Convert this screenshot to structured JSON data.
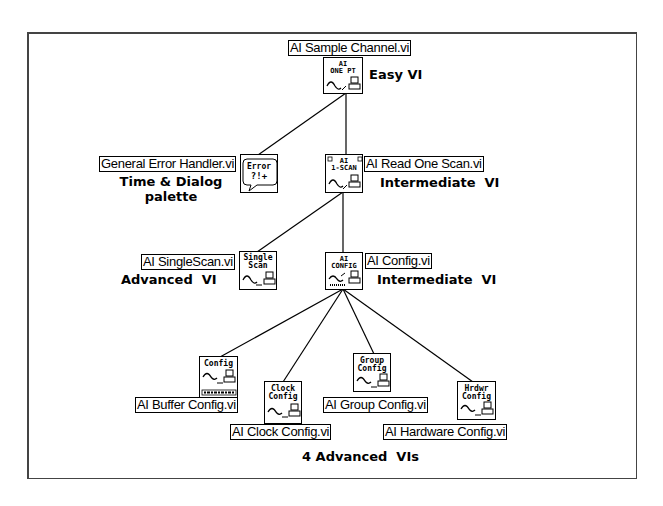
{
  "diagram": {
    "type": "hierarchy",
    "title": "",
    "nodes": [
      {
        "id": "sample",
        "vi_name": "AI Sample Channel.vi",
        "icon_text": [
          "AI",
          "ONE PT"
        ],
        "level_label": "Easy VI"
      },
      {
        "id": "error",
        "vi_name": "General Error Handler.vi",
        "icon_text": [
          "Error",
          "?!+"
        ],
        "level_label": "Time & Dialog palette",
        "level_label_lines": [
          "Time & Dialog",
          "palette"
        ]
      },
      {
        "id": "readone",
        "vi_name": "AI Read One Scan.vi",
        "icon_text": [
          "AI",
          "1-SCAN"
        ],
        "level_label": "Intermediate  VI"
      },
      {
        "id": "singlescan",
        "vi_name": "AI SingleScan.vi",
        "icon_text": [
          "Single",
          "Scan"
        ],
        "level_label": "Advanced  VI"
      },
      {
        "id": "config",
        "vi_name": "AI Config.vi",
        "icon_text": [
          "AI",
          "CONFIG"
        ],
        "level_label": "Intermediate  VI"
      },
      {
        "id": "buffer",
        "vi_name": "AI Buffer Config.vi",
        "icon_text": [
          "Config"
        ]
      },
      {
        "id": "clock",
        "vi_name": "AI Clock Config.vi",
        "icon_text": [
          "Clock",
          "Config"
        ]
      },
      {
        "id": "group",
        "vi_name": "AI Group Config.vi",
        "icon_text": [
          "Group",
          "Config"
        ]
      },
      {
        "id": "hardware",
        "vi_name": "AI Hardware Config.vi",
        "icon_text": [
          "Hrdwr",
          "Config"
        ]
      }
    ],
    "edges": [
      [
        "sample",
        "error"
      ],
      [
        "sample",
        "readone"
      ],
      [
        "readone",
        "singlescan"
      ],
      [
        "readone",
        "config"
      ],
      [
        "config",
        "buffer"
      ],
      [
        "config",
        "clock"
      ],
      [
        "config",
        "group"
      ],
      [
        "config",
        "hardware"
      ]
    ],
    "footer_label": "4 Advanced  VIs"
  },
  "labels": {
    "sample": "AI Sample Channel.vi",
    "sample_note": "Easy VI",
    "error": "General Error Handler.vi",
    "error_note_1": "Time & Dialog",
    "error_note_2": "palette",
    "readone": "AI Read One Scan.vi",
    "readone_note": "Intermediate  VI",
    "singlescan": "AI SingleScan.vi",
    "singlescan_note": "Advanced  VI",
    "config": "AI Config.vi",
    "config_note": "Intermediate  VI",
    "buffer": "AI Buffer Config.vi",
    "clock": "AI Clock Config.vi",
    "group": "AI Group Config.vi",
    "hardware": "AI Hardware Config.vi",
    "footer": "4 Advanced  VIs"
  },
  "icons": {
    "sample": {
      "l1": "AI",
      "l2": "ONE PT"
    },
    "error": {
      "l1": "Error",
      "l2": "?!+"
    },
    "readone": {
      "l1": "AI",
      "l2": "1-SCAN"
    },
    "singlescan": {
      "l1": "Single",
      "l2": "Scan"
    },
    "config": {
      "l1": "AI",
      "l2": "CONFIG"
    },
    "buffer": {
      "l1": "Config"
    },
    "clock": {
      "l1": "Clock",
      "l2": "Config"
    },
    "group": {
      "l1": "Group",
      "l2": "Config"
    },
    "hardware": {
      "l1": "Hrdwr",
      "l2": "Config"
    }
  }
}
